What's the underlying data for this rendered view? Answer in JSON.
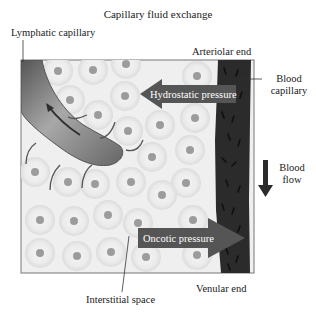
{
  "title": "Capillary fluid exchange",
  "labels": {
    "lymphatic_capillary": "Lymphatic capillary",
    "arteriolar_end": "Arteriolar end",
    "blood_capillary_line1": "Blood",
    "blood_capillary_line2": "capillary",
    "blood_flow_line1": "Blood",
    "blood_flow_line2": "flow",
    "interstitial_space": "Interstitial space",
    "venular_end": "Venular end"
  },
  "arrows": {
    "hydrostatic": {
      "label": "Hydrostatic pressure",
      "direction": "left"
    },
    "oncotic": {
      "label": "Oncotic pressure",
      "direction": "right"
    },
    "blood_flow": {
      "direction": "down"
    }
  },
  "colors": {
    "background": "#ffffff",
    "interstitium": "#efefef",
    "cell_ring": "#e2e2e2",
    "cell_nucleus": "#9c9c9c",
    "blood_capillary": "#2b2b2b",
    "pressure_arrow": "#555555",
    "lymphatic": "#7a7a7a",
    "frame": "#777777"
  }
}
